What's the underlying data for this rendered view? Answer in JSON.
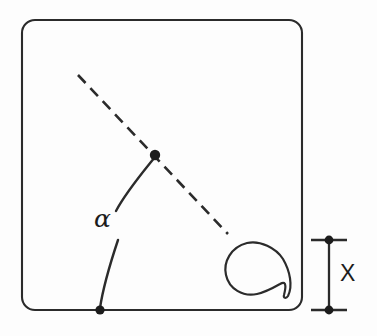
{
  "figure": {
    "background_color": "#fdfdfd",
    "ink_color": "#2b2b2b",
    "width": 377,
    "height": 336,
    "frame": {
      "name": "rounded-rectangle-boundary",
      "x": 22,
      "y": 20,
      "width": 280,
      "height": 290,
      "corner_radius": 13,
      "stroke_width": 2.1
    },
    "dashed_axis": {
      "name": "dashed-reference-line",
      "x1": 78,
      "y1": 75,
      "x2": 228,
      "y2": 234,
      "dash_length": 11,
      "gap_length": 7,
      "stroke_width": 2.6
    },
    "angle_arc": {
      "name": "angle-arc",
      "upper_segment": "M 155 157 C 143 172 126 192 116 211",
      "lower_segment": "M 118 240 C 110 264 103 288 100 308",
      "stroke_width": 2.4
    },
    "teardrop": {
      "name": "teardrop-region",
      "path": "M 247 243 C 231 247 223 262 226 275 C 229 289 243 297 257 294 C 266 292 273 288 280 284 C 288 279 285 291 284 295 C 283 298 286 299 288 296 C 293 286 290 271 283 259 C 276 248 260 240 247 243 Z",
      "stroke_width": 2.2
    },
    "dots": [
      {
        "name": "vertex-dot",
        "cx": 155,
        "cy": 155,
        "r": 5.2
      },
      {
        "name": "origin-dot",
        "cx": 100,
        "cy": 310,
        "r": 4.6
      },
      {
        "name": "scale-top-dot",
        "cx": 329,
        "cy": 240,
        "r": 4.4
      },
      {
        "name": "scale-bottom-dot",
        "cx": 329,
        "cy": 310,
        "r": 4.4
      }
    ],
    "scale_bar": {
      "name": "scale-bar",
      "top_tick": {
        "x1": 311,
        "y1": 240,
        "x2": 347,
        "y2": 240
      },
      "bottom_tick": {
        "x1": 311,
        "y1": 310,
        "x2": 347,
        "y2": 310
      },
      "vertical": {
        "x1": 329,
        "y1": 240,
        "x2": 329,
        "y2": 310
      }
    },
    "labels": {
      "angle": "α",
      "scale": "X"
    }
  }
}
